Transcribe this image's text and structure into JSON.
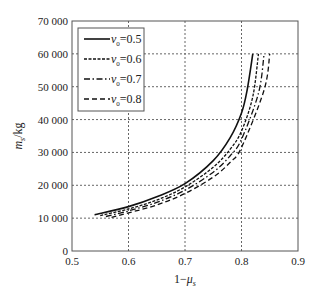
{
  "chart_data": {
    "type": "line",
    "title": "",
    "xlabel": "1−μ_s",
    "ylabel": "m_s/kg",
    "xlim": [
      0.5,
      0.9
    ],
    "ylim": [
      0,
      70000
    ],
    "xticks": [
      0.5,
      0.6,
      0.7,
      0.8,
      0.9
    ],
    "xtick_labels": [
      "0.5",
      "0.6",
      "0.7",
      "0.8",
      "0.9"
    ],
    "yticks": [
      0,
      10000,
      20000,
      30000,
      40000,
      50000,
      60000,
      70000
    ],
    "ytick_labels": [
      "0",
      "10 000",
      "20 000",
      "30 000",
      "40 000",
      "50 000",
      "60 000",
      "70 000"
    ],
    "grid": true,
    "legend_position": "upper left",
    "series": [
      {
        "name": "ν₀=0.5",
        "style": "solid",
        "x": [
          0.54,
          0.6,
          0.65,
          0.7,
          0.75,
          0.78,
          0.8,
          0.81,
          0.82
        ],
        "y": [
          11000,
          13500,
          16500,
          20500,
          27500,
          34500,
          42000,
          49000,
          60000
        ]
      },
      {
        "name": "ν₀=0.6",
        "style": "dotted",
        "x": [
          0.55,
          0.6,
          0.65,
          0.7,
          0.75,
          0.78,
          0.8,
          0.82,
          0.83
        ],
        "y": [
          10800,
          12800,
          15500,
          19500,
          25500,
          31000,
          36500,
          47000,
          60000
        ]
      },
      {
        "name": "ν₀=0.7",
        "style": "dashdot",
        "x": [
          0.56,
          0.6,
          0.65,
          0.7,
          0.75,
          0.78,
          0.8,
          0.83,
          0.84
        ],
        "y": [
          10500,
          12200,
          14800,
          18500,
          24000,
          29000,
          34000,
          48000,
          60000
        ]
      },
      {
        "name": "ν₀=0.8",
        "style": "dashed",
        "x": [
          0.57,
          0.6,
          0.65,
          0.7,
          0.75,
          0.78,
          0.8,
          0.84,
          0.85
        ],
        "y": [
          10200,
          11600,
          14000,
          17500,
          22500,
          27000,
          31500,
          49000,
          60000
        ]
      }
    ]
  },
  "legend": {
    "items": [
      {
        "prefix": "ν",
        "sub": "0",
        "value": "=0.5"
      },
      {
        "prefix": "ν",
        "sub": "0",
        "value": "=0.6"
      },
      {
        "prefix": "ν",
        "sub": "0",
        "value": "=0.7"
      },
      {
        "prefix": "ν",
        "sub": "0",
        "value": "=0.8"
      }
    ]
  },
  "labels": {
    "x_main": "1−μ",
    "x_sub": "s",
    "y_main": "m",
    "y_sub": "s",
    "y_unit": "/kg"
  }
}
